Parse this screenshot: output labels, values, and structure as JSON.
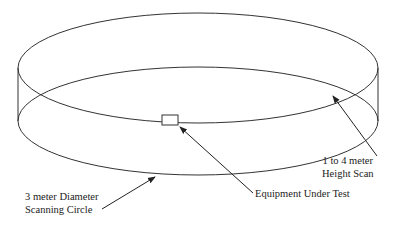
{
  "diagram": {
    "type": "test-site-geometry",
    "labels": {
      "diameter_line1": "3 meter Diameter",
      "diameter_line2": "Scanning Circle",
      "height_line1": "1 to 4 meter",
      "height_line2": "Height Scan",
      "eut": "Equipment Under Test"
    },
    "colors": {
      "stroke": "#333333",
      "background": "#ffffff"
    }
  }
}
